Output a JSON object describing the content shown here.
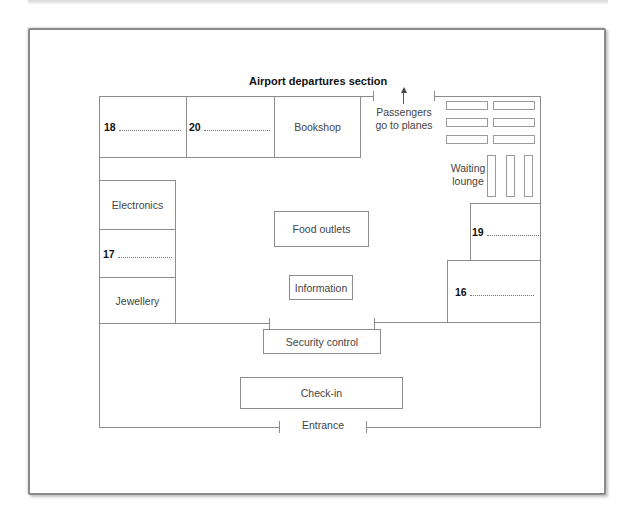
{
  "diagram": {
    "title": "Airport departures section",
    "exit_label": "Passengers go to planes",
    "exit_label_lines": [
      "Passengers",
      "go to planes"
    ],
    "entrance_label": "Entrance",
    "areas": {
      "bookshop": "Bookshop",
      "electronics": "Electronics",
      "jewellery": "Jewellery",
      "food_outlets": "Food outlets",
      "information": "Information",
      "security_control": "Security control",
      "check_in": "Check-in",
      "waiting_lounge_lines": [
        "Waiting",
        "lounge"
      ]
    },
    "questions": [
      {
        "number": "18",
        "answer": ""
      },
      {
        "number": "20",
        "answer": ""
      },
      {
        "number": "17",
        "answer": ""
      },
      {
        "number": "19",
        "answer": ""
      },
      {
        "number": "16",
        "answer": ""
      }
    ],
    "colors": {
      "wall": "#8c8c8c",
      "text": "#444444",
      "title": "#111111"
    }
  }
}
